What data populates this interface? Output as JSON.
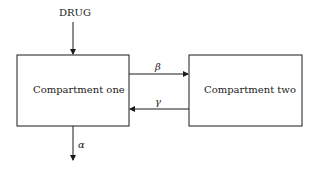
{
  "diagram": {
    "input_label": "DRUG",
    "compartments": [
      {
        "id": "one",
        "label": "Compartment one"
      },
      {
        "id": "two",
        "label": "Compartment two"
      }
    ],
    "rates": {
      "forward": "β",
      "backward": "γ",
      "elimination": "α"
    },
    "colors": {
      "line": "#1a1a1a",
      "background": "#ffffff"
    }
  }
}
